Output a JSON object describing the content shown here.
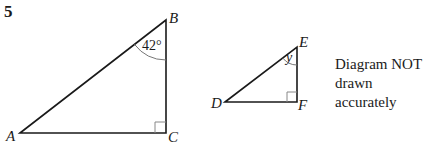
{
  "question": {
    "number": "5"
  },
  "triangle_abc": {
    "vertices": {
      "A": {
        "label": "A",
        "x": 20,
        "y": 133
      },
      "B": {
        "label": "B",
        "x": 166,
        "y": 20
      },
      "C": {
        "label": "C",
        "x": 166,
        "y": 133
      }
    },
    "angle_B": "42°",
    "right_angle_at": "C"
  },
  "triangle_def": {
    "vertices": {
      "D": {
        "label": "D",
        "x": 225,
        "y": 102
      },
      "E": {
        "label": "E",
        "x": 297,
        "y": 47
      },
      "F": {
        "label": "F",
        "x": 297,
        "y": 102
      }
    },
    "angle_E": "y",
    "right_angle_at": "F"
  },
  "note": {
    "line1": "Diagram NOT",
    "line2": "drawn accurately"
  },
  "colors": {
    "line": "#1a1a1a",
    "arc": "#777777",
    "right_angle_box": "#888888",
    "background": "#ffffff"
  }
}
